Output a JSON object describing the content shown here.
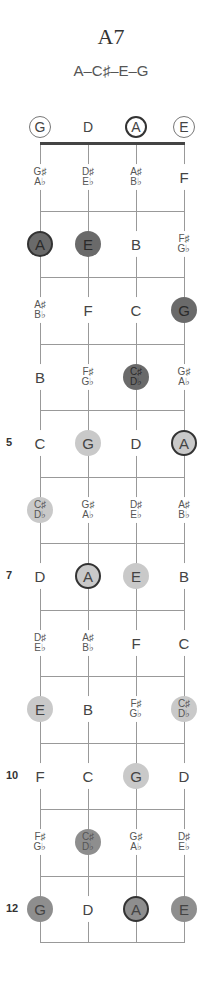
{
  "chord": {
    "name": "A7",
    "notes": "A–C♯–E–G"
  },
  "strings": [
    {
      "open": "G",
      "open_style": "ring"
    },
    {
      "open": "D",
      "open_style": "none"
    },
    {
      "open": "A",
      "open_style": "root"
    },
    {
      "open": "E",
      "open_style": "ring"
    }
  ],
  "fret_numbers": [
    {
      "fret": 5,
      "label": "5"
    },
    {
      "fret": 7,
      "label": "7"
    },
    {
      "fret": 10,
      "label": "10"
    },
    {
      "fret": 12,
      "label": "12"
    }
  ],
  "frets": [
    {
      "fret": 1,
      "cells": [
        {
          "top": "G♯",
          "bottom": "A♭",
          "style": ""
        },
        {
          "top": "D♯",
          "bottom": "E♭",
          "style": ""
        },
        {
          "top": "A♯",
          "bottom": "B♭",
          "style": ""
        },
        {
          "top": "F",
          "bottom": "",
          "style": ""
        }
      ]
    },
    {
      "fret": 2,
      "cells": [
        {
          "top": "A",
          "bottom": "",
          "style": "dark root"
        },
        {
          "top": "E",
          "bottom": "",
          "style": "dark"
        },
        {
          "top": "B",
          "bottom": "",
          "style": ""
        },
        {
          "top": "F♯",
          "bottom": "G♭",
          "style": ""
        }
      ]
    },
    {
      "fret": 3,
      "cells": [
        {
          "top": "A♯",
          "bottom": "B♭",
          "style": ""
        },
        {
          "top": "F",
          "bottom": "",
          "style": ""
        },
        {
          "top": "C",
          "bottom": "",
          "style": ""
        },
        {
          "top": "G",
          "bottom": "",
          "style": "dark"
        }
      ]
    },
    {
      "fret": 4,
      "cells": [
        {
          "top": "B",
          "bottom": "",
          "style": ""
        },
        {
          "top": "F♯",
          "bottom": "G♭",
          "style": ""
        },
        {
          "top": "C♯",
          "bottom": "D♭",
          "style": "dark"
        },
        {
          "top": "G♯",
          "bottom": "A♭",
          "style": ""
        }
      ]
    },
    {
      "fret": 5,
      "cells": [
        {
          "top": "C",
          "bottom": "",
          "style": ""
        },
        {
          "top": "G",
          "bottom": "",
          "style": "light"
        },
        {
          "top": "D",
          "bottom": "",
          "style": ""
        },
        {
          "top": "A",
          "bottom": "",
          "style": "light root"
        }
      ]
    },
    {
      "fret": 6,
      "cells": [
        {
          "top": "C♯",
          "bottom": "D♭",
          "style": "light"
        },
        {
          "top": "G♯",
          "bottom": "A♭",
          "style": ""
        },
        {
          "top": "D♯",
          "bottom": "E♭",
          "style": ""
        },
        {
          "top": "A♯",
          "bottom": "B♭",
          "style": ""
        }
      ]
    },
    {
      "fret": 7,
      "cells": [
        {
          "top": "D",
          "bottom": "",
          "style": ""
        },
        {
          "top": "A",
          "bottom": "",
          "style": "light root"
        },
        {
          "top": "E",
          "bottom": "",
          "style": "light"
        },
        {
          "top": "B",
          "bottom": "",
          "style": ""
        }
      ]
    },
    {
      "fret": 8,
      "cells": [
        {
          "top": "D♯",
          "bottom": "E♭",
          "style": ""
        },
        {
          "top": "A♯",
          "bottom": "B♭",
          "style": ""
        },
        {
          "top": "F",
          "bottom": "",
          "style": ""
        },
        {
          "top": "C",
          "bottom": "",
          "style": ""
        }
      ]
    },
    {
      "fret": 9,
      "cells": [
        {
          "top": "E",
          "bottom": "",
          "style": "light"
        },
        {
          "top": "B",
          "bottom": "",
          "style": ""
        },
        {
          "top": "F♯",
          "bottom": "G♭",
          "style": ""
        },
        {
          "top": "C♯",
          "bottom": "D♭",
          "style": "light"
        }
      ]
    },
    {
      "fret": 10,
      "cells": [
        {
          "top": "F",
          "bottom": "",
          "style": ""
        },
        {
          "top": "C",
          "bottom": "",
          "style": ""
        },
        {
          "top": "G",
          "bottom": "",
          "style": "light"
        },
        {
          "top": "D",
          "bottom": "",
          "style": ""
        }
      ]
    },
    {
      "fret": 11,
      "cells": [
        {
          "top": "F♯",
          "bottom": "G♭",
          "style": ""
        },
        {
          "top": "C♯",
          "bottom": "D♭",
          "style": "mid"
        },
        {
          "top": "G♯",
          "bottom": "A♭",
          "style": ""
        },
        {
          "top": "D♯",
          "bottom": "E♭",
          "style": ""
        }
      ]
    },
    {
      "fret": 12,
      "cells": [
        {
          "top": "G",
          "bottom": "",
          "style": "mid"
        },
        {
          "top": "D",
          "bottom": "",
          "style": ""
        },
        {
          "top": "A",
          "bottom": "",
          "style": "mid root"
        },
        {
          "top": "E",
          "bottom": "",
          "style": "mid"
        }
      ]
    }
  ],
  "colors": {
    "dark": "#6a6a6a",
    "mid": "#8e8e8e",
    "light": "#c9c9c9",
    "root_ring": "#333333"
  }
}
